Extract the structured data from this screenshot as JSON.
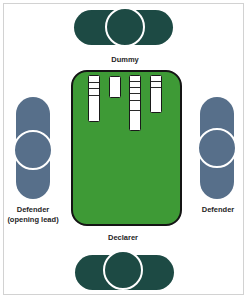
{
  "diagram": {
    "colors": {
      "partnership_ns": "#1d4a44",
      "partnership_ew": "#576f8a",
      "table_felt": "#3e9a36",
      "table_border": "#141414",
      "circle_outline": "#ffffff",
      "card_face": "#ffffff",
      "label_text": "#1e1e1e"
    },
    "seats": {
      "north": {
        "label": "Dummy",
        "orientation": "horizontal"
      },
      "south": {
        "label": "Declarer",
        "orientation": "horizontal"
      },
      "west": {
        "label_line1": "Defender",
        "label_line2": "(opening lead)",
        "orientation": "vertical"
      },
      "east": {
        "label": "Defender",
        "orientation": "vertical"
      }
    },
    "dummy_cards": {
      "columns": [
        {
          "index": 1,
          "card_count": 4
        },
        {
          "index": 2,
          "card_count": 1
        },
        {
          "index": 3,
          "card_count": 6
        },
        {
          "index": 4,
          "card_count": 3
        }
      ],
      "total_cards": 14
    }
  }
}
